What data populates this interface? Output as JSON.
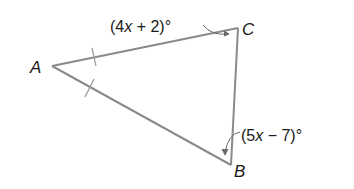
{
  "diagram": {
    "type": "triangle",
    "colors": {
      "stroke": "#8a8a8a",
      "text": "#1a1a1a",
      "background": "#ffffff"
    },
    "vertices": {
      "A": {
        "label": "A"
      },
      "B": {
        "label": "B"
      },
      "C": {
        "label": "C"
      }
    },
    "angles": {
      "C": {
        "open": "(4",
        "var": "x",
        "rest": " + 2)°"
      },
      "B": {
        "open": "(5",
        "var": "x",
        "rest": " − 7)°"
      }
    },
    "congruent_sides": [
      "AC",
      "AB"
    ]
  }
}
